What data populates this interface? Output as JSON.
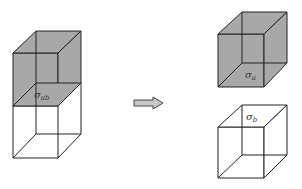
{
  "diagram": {
    "left": {
      "label_main": "σ",
      "label_sub": "ab",
      "top_fill": "#a8a8a8",
      "bottom_fill": "#ffffff"
    },
    "arrow": {
      "direction": "right",
      "fill": "#c8c8c8",
      "stroke": "#444444"
    },
    "right_top": {
      "label_main": "σ",
      "label_sub": "a",
      "fill": "#a8a8a8"
    },
    "right_bottom": {
      "label_main": "σ",
      "label_sub": "b",
      "fill": "#ffffff"
    },
    "line_color": "#222222"
  }
}
